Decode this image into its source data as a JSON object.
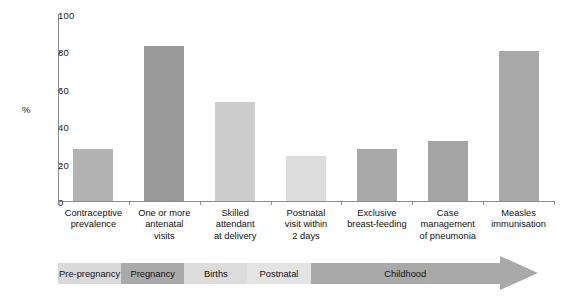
{
  "chart_data": {
    "type": "bar",
    "title": "",
    "xlabel": "",
    "ylabel": "%",
    "ylim": [
      0,
      100
    ],
    "yticks": [
      0,
      20,
      40,
      60,
      80,
      100
    ],
    "grid": false,
    "legend": null,
    "categories": [
      "Contraceptive prevalence",
      "One or more antenatal visits",
      "Skilled attendant at delivery",
      "Postnatal visit within 2 days",
      "Exclusive breast-feeding",
      "Case management of pneumonia",
      "Measles immunisation"
    ],
    "category_lines": [
      [
        "Contraceptive",
        "prevalence"
      ],
      [
        "One or more",
        "antenatal",
        "visits"
      ],
      [
        "Skilled",
        "attendant",
        "at delivery"
      ],
      [
        "Postnatal",
        "visit within",
        "2 days"
      ],
      [
        "Exclusive",
        "breast-feeding"
      ],
      [
        "Case",
        "management",
        "of pneumonia"
      ],
      [
        "Measles",
        "immunisation"
      ]
    ],
    "values": [
      28,
      83,
      53,
      24,
      28,
      32,
      80
    ],
    "bar_colors": [
      "#b2b2b2",
      "#9a9a9a",
      "#cdcdcd",
      "#dcdcdc",
      "#a9a9a9",
      "#a5a5a5",
      "#a9a9a9"
    ],
    "stages": [
      {
        "label": "Pre-pregnancy",
        "color": "#d9d9d9",
        "start": 0,
        "end": 1
      },
      {
        "label": "Pregnancy",
        "color": "#a9a9a9",
        "start": 1,
        "end": 2
      },
      {
        "label": "Births",
        "color": "#dcdcdc",
        "start": 2,
        "end": 3
      },
      {
        "label": "Postnatal",
        "color": "#e4e4e4",
        "start": 3,
        "end": 4
      },
      {
        "label": "Childhood",
        "color": "#a9a9a9",
        "start": 4,
        "end": 7
      }
    ],
    "arrow_color": "#a9a9a9"
  }
}
